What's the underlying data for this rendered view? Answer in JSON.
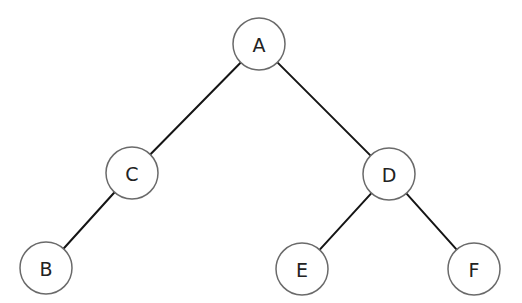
{
  "diagram": {
    "type": "binary-tree",
    "colors": {
      "background": "#ffffff",
      "edge": "#151515",
      "node_stroke": "#6a6a6a",
      "node_fill": "#ffffff",
      "label": "#222222"
    },
    "node_radius": 26,
    "nodes": [
      {
        "id": "A",
        "label": "A",
        "x": 259,
        "y": 44
      },
      {
        "id": "C",
        "label": "C",
        "x": 132,
        "y": 173
      },
      {
        "id": "D",
        "label": "D",
        "x": 389,
        "y": 174
      },
      {
        "id": "B",
        "label": "B",
        "x": 46,
        "y": 268
      },
      {
        "id": "E",
        "label": "E",
        "x": 302,
        "y": 269
      },
      {
        "id": "F",
        "label": "F",
        "x": 474,
        "y": 269
      }
    ],
    "edges": [
      {
        "from": "A",
        "to": "C"
      },
      {
        "from": "A",
        "to": "D"
      },
      {
        "from": "C",
        "to": "B"
      },
      {
        "from": "D",
        "to": "E"
      },
      {
        "from": "D",
        "to": "F"
      }
    ]
  }
}
